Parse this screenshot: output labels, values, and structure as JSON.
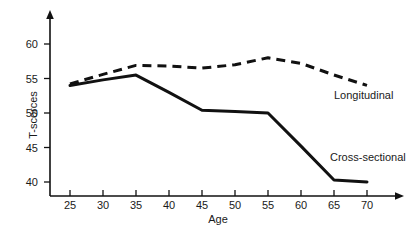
{
  "chart_data": {
    "type": "line",
    "title": "",
    "xlabel": "Age",
    "ylabel": "T-scorces",
    "x": [
      25,
      30,
      35,
      40,
      45,
      50,
      55,
      60,
      65,
      70
    ],
    "xlim": [
      22.5,
      73
    ],
    "ylim": [
      37.5,
      62
    ],
    "xticks": [
      25,
      30,
      35,
      40,
      45,
      50,
      55,
      60,
      65,
      70
    ],
    "yticks": [
      40,
      45,
      50,
      55,
      60
    ],
    "grid": false,
    "legend_position": "inline-right",
    "series": [
      {
        "name": "Longitudinal",
        "style": "dashed",
        "color": "#111111",
        "values": [
          54.2,
          55.6,
          56.9,
          56.8,
          56.5,
          57.0,
          58.0,
          57.2,
          55.5,
          54.0
        ]
      },
      {
        "name": "Cross-sectional",
        "style": "solid",
        "color": "#111111",
        "values": [
          54.0,
          54.8,
          55.5,
          53.0,
          50.4,
          50.2,
          50.0,
          45.2,
          40.3,
          40.0
        ]
      }
    ],
    "annotations": [
      {
        "text": "Longitudinal",
        "x": 70,
        "y": 54.8
      },
      {
        "text": "Cross-sectional",
        "x": 68,
        "y": 45.5
      }
    ],
    "axis_style": {
      "axis_color": "#111111",
      "arrowheads": true,
      "spines": [
        "left",
        "bottom"
      ]
    }
  }
}
